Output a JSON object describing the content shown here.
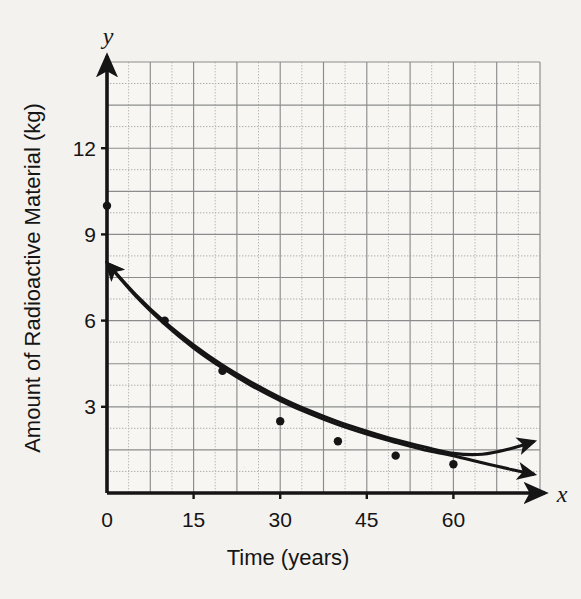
{
  "chart_data": {
    "type": "scatter",
    "title": "",
    "subtitle": "",
    "xlabel": "Time (years)",
    "ylabel": "Amount of Radioactive Material (kg)",
    "x_var_label": "x",
    "y_var_label": "y",
    "xlim": [
      0,
      75
    ],
    "ylim": [
      0,
      15
    ],
    "xticks": [
      0,
      15,
      30,
      45,
      60
    ],
    "xtick_labels": [
      "0",
      "15",
      "30",
      "45",
      "60"
    ],
    "yticks": [
      3,
      6,
      9,
      12
    ],
    "ytick_labels": [
      "3",
      "6",
      "9",
      "12"
    ],
    "origin_label": "0",
    "grid": true,
    "grid_major_x_step": 7.5,
    "grid_major_y_step": 1.5,
    "legend_position": "none",
    "points": [
      {
        "x": 0,
        "y": 10.0
      },
      {
        "x": 10,
        "y": 6.0
      },
      {
        "x": 20,
        "y": 4.25
      },
      {
        "x": 30,
        "y": 2.5
      },
      {
        "x": 40,
        "y": 1.8
      },
      {
        "x": 50,
        "y": 1.3
      },
      {
        "x": 60,
        "y": 1.0
      }
    ],
    "series": [
      {
        "name": "curve-upper",
        "style": "solid",
        "arrow_start": true,
        "arrow_end": true,
        "x": [
          0,
          5,
          10,
          15,
          20,
          25,
          30,
          35,
          40,
          45,
          50,
          55,
          60,
          65,
          70,
          74
        ],
        "values": [
          8.0,
          6.9,
          5.95,
          5.15,
          4.45,
          3.85,
          3.32,
          2.87,
          2.48,
          2.15,
          1.85,
          1.6,
          1.38,
          1.35,
          1.55,
          1.8
        ]
      },
      {
        "name": "curve-lower",
        "style": "solid",
        "arrow_start": true,
        "arrow_end": true,
        "x": [
          0,
          5,
          10,
          15,
          20,
          25,
          30,
          35,
          40,
          45,
          50,
          55,
          60,
          65,
          70,
          74
        ],
        "values": [
          8.0,
          6.85,
          5.88,
          5.05,
          4.35,
          3.74,
          3.22,
          2.77,
          2.38,
          2.05,
          1.76,
          1.5,
          1.3,
          1.05,
          0.82,
          0.65
        ]
      }
    ],
    "annotations": [],
    "colors": {
      "ink": "#151515",
      "grid_major": "#8a8a8a",
      "grid_minor": "#b3b3b3",
      "paper": "#f3f2ef",
      "plot_fill": "#f7f6f3"
    }
  }
}
